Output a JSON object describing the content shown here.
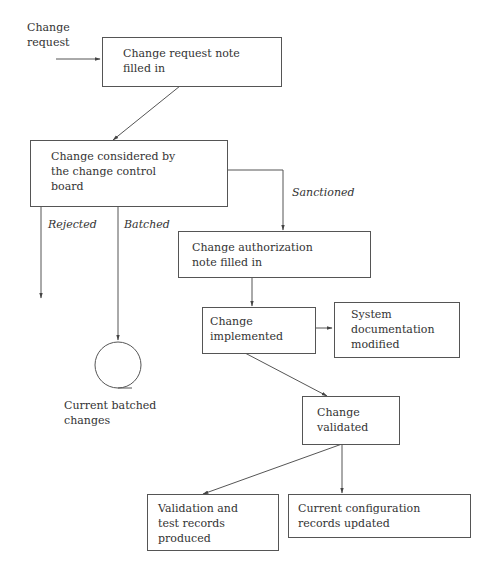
{
  "diagram": {
    "input_label": "Change\nrequest",
    "nodes": {
      "request_note": "Change request note\nfilled in",
      "ccb": "Change considered by\nthe change control\nboard",
      "auth_note": "Change authorization\n note filled in",
      "implemented": "Change\nimplemented",
      "sysdoc": "System\ndocumentation\nmodified",
      "validated": "Change\nvalidated",
      "test_records": "Validation and\ntest records\nproduced",
      "config_records": "Current configuration\nrecords updated"
    },
    "edge_labels": {
      "rejected": "Rejected",
      "batched": "Batched",
      "sanctioned": "Sanctioned"
    },
    "store_label": "Current batched\nchanges",
    "colors": {
      "stroke": "#555555",
      "text": "#333333"
    }
  }
}
